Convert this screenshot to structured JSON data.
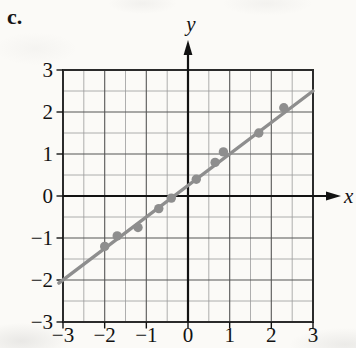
{
  "figure": {
    "label": "c."
  },
  "chart_data": {
    "type": "scatter",
    "title": "",
    "xlabel": "x",
    "ylabel": "y",
    "xlim": [
      -3,
      3
    ],
    "ylim": [
      -3,
      3
    ],
    "grid": "on",
    "grid_minor_step": 0.5,
    "grid_major_step": 1,
    "x_ticks": [
      -3,
      -2,
      -1,
      0,
      1,
      2,
      3
    ],
    "y_ticks": [
      -3,
      -2,
      -1,
      0,
      1,
      2,
      3
    ],
    "points": [
      [
        -2.0,
        -1.2
      ],
      [
        -1.7,
        -0.95
      ],
      [
        -1.2,
        -0.75
      ],
      [
        -0.7,
        -0.3
      ],
      [
        -0.4,
        -0.05
      ],
      [
        0.2,
        0.4
      ],
      [
        0.65,
        0.8
      ],
      [
        0.85,
        1.05
      ],
      [
        1.7,
        1.5
      ],
      [
        2.3,
        2.1
      ]
    ],
    "trend_line": {
      "slope": 0.75,
      "intercept": 0.25,
      "x_start": -3.1,
      "x_end": 3.0
    },
    "legend": "none",
    "colors": {
      "paper": "#fbfaf7",
      "points": "#8e8e8e",
      "trend_line": "#8e8e8e",
      "grid_minor": "#9a9a9a",
      "grid_major": "#555555",
      "axis": "#121212",
      "border": "#2b2b2b",
      "text": "#121212"
    }
  }
}
